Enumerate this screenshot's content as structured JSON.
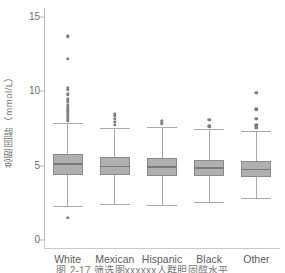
{
  "chart_data": {
    "type": "boxplot",
    "title": "",
    "xlabel": "",
    "ylabel": "总胆固醇（mmol/L）",
    "ylim": [
      0,
      15.6
    ],
    "yticks": [
      0,
      5,
      10,
      15
    ],
    "ytick_labels": [
      "0",
      "5",
      "10",
      "15"
    ],
    "grid": false,
    "legend": "none",
    "categories": [
      "White",
      "Mexican",
      "Hispanic",
      "Black",
      "Other"
    ],
    "boxes": [
      {
        "name": "White",
        "whisker_low": 2.3,
        "q1": 4.4,
        "median": 5.1,
        "q3": 5.8,
        "whisker_high": 7.9,
        "outliers": [
          1.5,
          8.05,
          8.2,
          8.35,
          8.5,
          8.65,
          8.8,
          8.95,
          9.1,
          9.3,
          9.45,
          9.8,
          10.1,
          10.25,
          12.2,
          13.7
        ]
      },
      {
        "name": "Mexican",
        "whisker_low": 2.4,
        "q1": 4.35,
        "median": 4.95,
        "q3": 5.6,
        "whisker_high": 7.5,
        "outliers": [
          7.75,
          7.95,
          8.15,
          8.35,
          8.5
        ]
      },
      {
        "name": "Hispanic",
        "whisker_low": 2.35,
        "q1": 4.3,
        "median": 4.9,
        "q3": 5.5,
        "whisker_high": 7.6,
        "outliers": [
          7.85,
          8.0
        ]
      },
      {
        "name": "Black",
        "whisker_low": 2.55,
        "q1": 4.3,
        "median": 4.85,
        "q3": 5.4,
        "whisker_high": 7.45,
        "outliers": [
          7.65,
          8.1
        ]
      },
      {
        "name": "Other",
        "whisker_low": 2.85,
        "q1": 4.25,
        "median": 4.75,
        "q3": 5.3,
        "whisker_high": 7.35,
        "outliers": [
          7.55,
          7.7,
          8.15,
          8.8,
          9.9
        ]
      }
    ],
    "colors": {
      "box_fill": "#b0b0b0",
      "box_edge": "#8a8a8a",
      "median": "#7a7a7a",
      "whisker": "#aaaaaa",
      "outlier": "#7e7e7e",
      "axis": "#b6b6b6",
      "tick_text": "#6f6f6f",
      "category_text": "#5d5d5d",
      "label_text": "#777777"
    }
  },
  "caption": {
    "text": "图 2-17  筛选图xxxxxx人群胆固醇水平"
  }
}
